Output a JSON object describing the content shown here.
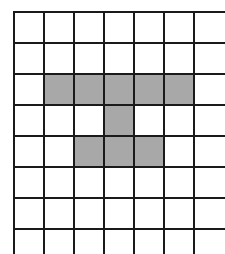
{
  "diagram": {
    "type": "grid-shading",
    "grid": {
      "x_lines": [
        14,
        44,
        74,
        104,
        134,
        164,
        194
      ],
      "y_lines": [
        12,
        43,
        74,
        105,
        136,
        167,
        198,
        229
      ],
      "x_extent": [
        14,
        225
      ],
      "y_extent": [
        12,
        254
      ],
      "line_color": "#1a1a1a",
      "background": "#ffffff"
    },
    "shade_color": "#a8a8a8",
    "shaded_cells": [
      {
        "row": 2,
        "col": 1
      },
      {
        "row": 2,
        "col": 2
      },
      {
        "row": 2,
        "col": 3
      },
      {
        "row": 2,
        "col": 4
      },
      {
        "row": 2,
        "col": 5
      },
      {
        "row": 3,
        "col": 3
      },
      {
        "row": 4,
        "col": 2
      },
      {
        "row": 4,
        "col": 3
      },
      {
        "row": 4,
        "col": 4
      }
    ]
  }
}
